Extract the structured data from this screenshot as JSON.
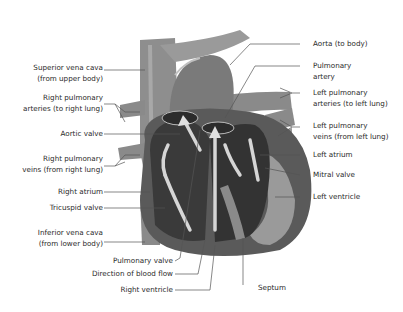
{
  "labels_left": [
    {
      "id": "superior-vena-cava",
      "lines": [
        "Superior vena cava",
        "(from upper body)"
      ]
    },
    {
      "id": "right-pulmonary-arteries",
      "lines": [
        "Right pulmonary",
        "arteries (to right lung)"
      ]
    },
    {
      "id": "aortic-valve",
      "lines": [
        "Aortic valve"
      ]
    },
    {
      "id": "right-pulmonary-veins",
      "lines": [
        "Right pulmonary",
        "veins (from right lung)"
      ]
    },
    {
      "id": "right-atrium",
      "lines": [
        "Right atrium"
      ]
    },
    {
      "id": "tricuspid-valve",
      "lines": [
        "Tricuspid valve"
      ]
    },
    {
      "id": "inferior-vena-cava",
      "lines": [
        "Inferior vena cava",
        "(from lower body)"
      ]
    },
    {
      "id": "pulmonary-valve",
      "lines": [
        "Pulmonary valve"
      ]
    },
    {
      "id": "direction-of-blood-flow",
      "lines": [
        "Direction of blood flow"
      ]
    },
    {
      "id": "right-ventricle",
      "lines": [
        "Right ventricle"
      ]
    }
  ],
  "labels_right": [
    {
      "id": "aorta",
      "lines": [
        "Aorta (to body)"
      ]
    },
    {
      "id": "pulmonary-artery",
      "lines": [
        "Pulmonary",
        "artery"
      ]
    },
    {
      "id": "left-pulmonary-arteries",
      "lines": [
        "Left pulmonary",
        "arteries (to left lung)"
      ]
    },
    {
      "id": "left-pulmonary-veins",
      "lines": [
        "Left pulmonary",
        "veins (from left lung)"
      ]
    },
    {
      "id": "left-atrium",
      "lines": [
        "Left atrium"
      ]
    },
    {
      "id": "mitral-valve",
      "lines": [
        "Mitral valve"
      ]
    },
    {
      "id": "left-ventricle",
      "lines": [
        "Left ventricle"
      ]
    }
  ],
  "labels_bottom": [
    {
      "id": "septum",
      "lines": [
        "Septum"
      ]
    }
  ],
  "colors": {
    "vessel": "#8a8a8a",
    "vessel_dark": "#6e6e6e",
    "chamber": "#3c3c3c",
    "wall": "#9a9a9a",
    "arrow": "#d8d8d8",
    "leader": "#555555",
    "text": "#2a2a2a"
  }
}
